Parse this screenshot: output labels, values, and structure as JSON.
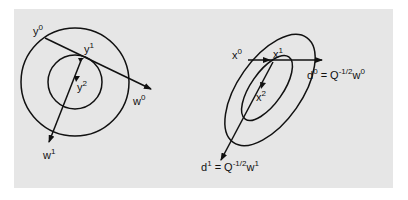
{
  "diagram": {
    "left_panel": {
      "labels": {
        "y0": {
          "base": "y",
          "sup": "0"
        },
        "y1": {
          "base": "y",
          "sup": "1"
        },
        "y2": {
          "base": "y",
          "sup": "2"
        },
        "w0": {
          "base": "w",
          "sup": "0"
        },
        "w1": {
          "base": "w",
          "sup": "1"
        }
      }
    },
    "right_panel": {
      "labels": {
        "x0": {
          "base": "x",
          "sup": "0"
        },
        "x1": {
          "base": "x",
          "sup": "1"
        },
        "x2": {
          "base": "x",
          "sup": "2"
        },
        "d0": {
          "lhs": "d",
          "lhs_sup": "0",
          "eq": " = Q",
          "exp": "-1/2",
          "w": "w",
          "w_sup": "0"
        },
        "d1": {
          "lhs": "d",
          "lhs_sup": "1",
          "eq": " = Q",
          "exp": "-1/2",
          "w": "w",
          "w_sup": "1"
        }
      }
    },
    "colors": {
      "background": "#e6e6e6",
      "stroke": "#111111"
    }
  }
}
